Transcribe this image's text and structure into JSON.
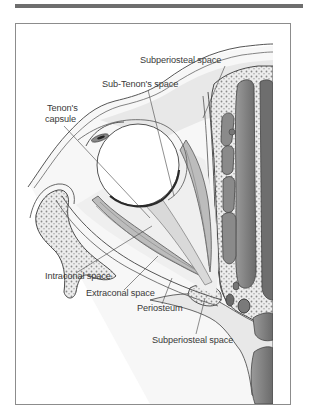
{
  "figure": {
    "type": "anatomical cross-section of the orbit",
    "labels": {
      "subperiosteal_top": "Subperiosteal space",
      "sub_tenon": "Sub-Tenon's space",
      "tenon_line1": "Tenon's",
      "tenon_line2": "capsule",
      "intraconal": "Intraconal space",
      "extraconal": "Extraconal space",
      "periosteum": "Periosteum",
      "subperiosteal_bottom": "Subperiosteal space"
    },
    "colors": {
      "bone_dark": "#7d7d7d",
      "tissue_light": "#e6e6e6",
      "outline": "#4a4a4a",
      "frame_border": "#8c8c8c",
      "top_rule": "#6e6e6e"
    }
  }
}
